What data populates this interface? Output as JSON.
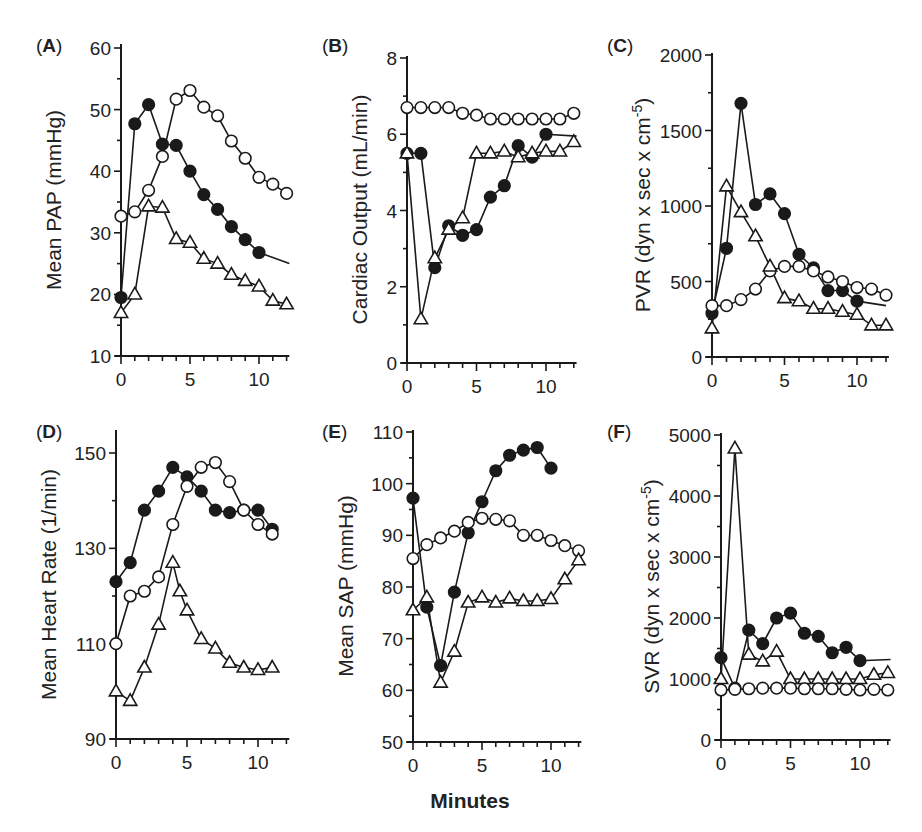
{
  "figure": {
    "xlabel": "Minutes"
  },
  "series_styles": {
    "filled_circle": {
      "marker": "circle",
      "fill": "#1a1a1a",
      "stroke": "#1a1a1a"
    },
    "open_circle": {
      "marker": "circle",
      "fill": "#ffffff",
      "stroke": "#1a1a1a"
    },
    "open_triangle": {
      "marker": "triangle",
      "fill": "#ffffff",
      "stroke": "#1a1a1a"
    }
  },
  "chart_data": [
    {
      "panel": "A",
      "type": "line",
      "ylabel": "Mean PAP (mmHg)",
      "xlabel": "",
      "xlim": [
        0,
        12.2
      ],
      "ylim": [
        10,
        60
      ],
      "xticks": [
        0,
        5,
        10
      ],
      "yticks": [
        10,
        20,
        30,
        40,
        50,
        60
      ],
      "px": {
        "x0": 121,
        "x10": 259,
        "y_axis_bottom": 356,
        "y_min_px": 356,
        "y_max_px": 48,
        "top": 44
      },
      "series": [
        {
          "style": "filled_circle",
          "x": [
            0,
            1,
            2,
            3,
            4,
            5,
            6,
            7,
            8,
            9,
            10
          ],
          "y": [
            19.5,
            47.7,
            50.8,
            44.4,
            44.2,
            40.0,
            36.2,
            33.8,
            31.0,
            28.9,
            26.8
          ],
          "tail": [
            12.2,
            25.0
          ]
        },
        {
          "style": "open_circle",
          "x": [
            0,
            1,
            2,
            3,
            4,
            5,
            6,
            7,
            8,
            9,
            10,
            11,
            12
          ],
          "y": [
            32.7,
            33.4,
            36.9,
            42.4,
            51.7,
            53.1,
            50.4,
            49.0,
            44.9,
            42.1,
            39.0,
            37.9,
            36.4
          ]
        },
        {
          "style": "open_triangle",
          "x": [
            0,
            1,
            2,
            3,
            4,
            5,
            6,
            7,
            8,
            9,
            10,
            11,
            12
          ],
          "y": [
            17.0,
            20.0,
            34.3,
            34.1,
            29.0,
            28.4,
            25.8,
            25.0,
            23.2,
            22.2,
            21.3,
            19.0,
            18.4
          ]
        }
      ]
    },
    {
      "panel": "B",
      "type": "line",
      "ylabel": "Cardiac Output (mL/min)",
      "xlabel": "",
      "xlim": [
        0,
        12.2
      ],
      "ylim": [
        0,
        8
      ],
      "xticks": [
        0,
        5,
        10
      ],
      "yticks": [
        0,
        2,
        4,
        6,
        8
      ],
      "px": {
        "x0": 407,
        "x10": 546,
        "y_axis_bottom": 363,
        "y_min_px": 363,
        "y_max_px": 58,
        "top": 56
      },
      "series": [
        {
          "style": "open_circle",
          "x": [
            0,
            1,
            2,
            3,
            4,
            5,
            6,
            7,
            8,
            9,
            10,
            11,
            12
          ],
          "y": [
            6.7,
            6.7,
            6.7,
            6.7,
            6.55,
            6.5,
            6.4,
            6.4,
            6.4,
            6.4,
            6.4,
            6.4,
            6.55
          ]
        },
        {
          "style": "filled_circle",
          "x": [
            0,
            1,
            2,
            3,
            4,
            5,
            6,
            7,
            8,
            9,
            10
          ],
          "y": [
            5.5,
            5.5,
            2.5,
            3.6,
            3.35,
            3.5,
            4.35,
            4.65,
            5.7,
            5.4,
            6.0
          ],
          "tail": [
            12.2,
            5.95
          ]
        },
        {
          "style": "open_triangle",
          "x": [
            0,
            1,
            2,
            3,
            4,
            5,
            6,
            7,
            8,
            9,
            10,
            11,
            12
          ],
          "y": [
            5.5,
            1.15,
            2.75,
            3.5,
            3.8,
            5.5,
            5.5,
            5.55,
            5.4,
            5.5,
            5.55,
            5.55,
            5.8
          ]
        }
      ]
    },
    {
      "panel": "C",
      "type": "line",
      "ylabel": "PVR (dyn x sec x cm",
      "ylabel_sup": "-5",
      "ylabel_end": ")",
      "xlabel": "",
      "xlim": [
        0,
        12.2
      ],
      "ylim": [
        0,
        2000
      ],
      "xticks": [
        0,
        5,
        10
      ],
      "yticks": [
        0,
        500,
        1000,
        1500,
        2000
      ],
      "px": {
        "x0": 712,
        "x10": 857,
        "y_axis_bottom": 357,
        "y_min_px": 357,
        "y_max_px": 55,
        "top": 53
      },
      "series": [
        {
          "style": "filled_circle",
          "x": [
            0,
            1,
            2,
            3,
            4,
            5,
            6,
            7,
            8,
            9,
            10
          ],
          "y": [
            290,
            720,
            1680,
            1010,
            1080,
            950,
            680,
            590,
            440,
            440,
            370
          ],
          "tail": [
            12,
            340
          ]
        },
        {
          "style": "open_circle",
          "x": [
            0,
            1,
            2,
            3,
            4,
            5,
            6,
            7,
            8,
            9,
            10,
            11,
            12
          ],
          "y": [
            340,
            340,
            380,
            450,
            570,
            600,
            600,
            570,
            530,
            500,
            460,
            450,
            410
          ]
        },
        {
          "style": "open_triangle",
          "x": [
            0,
            1,
            2,
            3,
            4,
            5,
            6,
            7,
            8,
            9,
            10,
            11,
            12
          ],
          "y": [
            190,
            1130,
            960,
            800,
            600,
            390,
            370,
            320,
            320,
            300,
            280,
            210,
            210
          ]
        }
      ]
    },
    {
      "panel": "D",
      "type": "line",
      "ylabel": "Mean Heart Rate (1/min)",
      "xlabel": "",
      "xlim": [
        0,
        12.2
      ],
      "ylim": [
        90,
        155
      ],
      "xticks": [
        0,
        5,
        10
      ],
      "yticks": [
        90,
        110,
        130,
        150
      ],
      "px": {
        "x0": 116,
        "x10": 258,
        "y_axis_bottom": 739,
        "y_min_px": 739,
        "y_max_px": 453,
        "top": 430
      },
      "series": [
        {
          "style": "filled_circle",
          "x": [
            0,
            1,
            2,
            3,
            4,
            5,
            6,
            7,
            8,
            9,
            10,
            11
          ],
          "y": [
            123,
            127,
            138,
            142,
            147,
            145,
            142,
            138,
            137.5,
            138,
            138,
            134
          ]
        },
        {
          "style": "open_circle",
          "x": [
            0,
            1,
            2,
            3,
            4,
            5,
            6,
            7,
            8,
            9,
            10,
            11
          ],
          "y": [
            110,
            120,
            121,
            124,
            135,
            143,
            147,
            148,
            144,
            138,
            135,
            133
          ]
        },
        {
          "style": "open_triangle",
          "x": [
            0,
            1,
            2,
            3,
            4,
            4.5,
            5,
            6,
            7,
            8,
            9,
            10,
            11
          ],
          "y": [
            100,
            98,
            105,
            114,
            127,
            121,
            117,
            111,
            109,
            106,
            105,
            104.5,
            105
          ]
        }
      ]
    },
    {
      "panel": "E",
      "type": "line",
      "ylabel": "Mean SAP (mmHg)",
      "xlabel": "Minutes",
      "xlim": [
        0,
        12.2
      ],
      "ylim": [
        50,
        110
      ],
      "xticks": [
        0,
        5,
        10
      ],
      "yticks": [
        50,
        60,
        70,
        80,
        90,
        100,
        110
      ],
      "px": {
        "x0": 413,
        "x10": 551,
        "y_axis_bottom": 742,
        "y_min_px": 742,
        "y_max_px": 432,
        "top": 430
      },
      "series": [
        {
          "style": "filled_circle",
          "x": [
            0,
            1,
            2,
            3,
            4,
            5,
            6,
            7,
            8,
            9,
            10
          ],
          "y": [
            97.2,
            76.1,
            64.8,
            79.0,
            90.5,
            96.5,
            102.5,
            105.5,
            106.5,
            107.0,
            103.0
          ]
        },
        {
          "style": "open_circle",
          "x": [
            0,
            1,
            2,
            3,
            4,
            5,
            6,
            7,
            8,
            9,
            10,
            11,
            12
          ],
          "y": [
            85.5,
            88.2,
            89.5,
            90.8,
            92.5,
            93.3,
            93.1,
            92.8,
            90.0,
            90.0,
            89.0,
            88.0,
            87.0
          ]
        },
        {
          "style": "open_triangle",
          "x": [
            0,
            1,
            2,
            3,
            4,
            5,
            6,
            7,
            8,
            9,
            10,
            11,
            12
          ],
          "y": [
            75.5,
            78.0,
            61.5,
            67.5,
            77.0,
            78.0,
            77.0,
            77.8,
            77.3,
            77.3,
            77.7,
            81.5,
            85.2
          ]
        }
      ]
    },
    {
      "panel": "F",
      "type": "line",
      "ylabel": "SVR (dyn x sec x cm",
      "ylabel_sup": "-5",
      "ylabel_end": ")",
      "xlabel": "",
      "xlim": [
        0,
        12.2
      ],
      "ylim": [
        0,
        5000
      ],
      "xticks": [
        0,
        5,
        10
      ],
      "yticks": [
        0,
        1000,
        2000,
        3000,
        4000,
        5000
      ],
      "px": {
        "x0": 721,
        "x10": 860,
        "y_axis_bottom": 740,
        "y_min_px": 740,
        "y_max_px": 435,
        "top": 433
      },
      "series": [
        {
          "style": "filled_circle",
          "x": [
            0,
            1,
            2,
            3,
            4,
            5,
            6,
            7,
            8,
            9,
            10
          ],
          "y": [
            1350,
            850,
            1800,
            1580,
            2000,
            2080,
            1750,
            1700,
            1430,
            1520,
            1300
          ],
          "tail": [
            12.2,
            1320
          ]
        },
        {
          "style": "open_triangle",
          "x": [
            0,
            1,
            2,
            3,
            4,
            5,
            6,
            7,
            8,
            9,
            10,
            11,
            12
          ],
          "y": [
            1000,
            4780,
            1400,
            1290,
            1450,
            1000,
            1000,
            1000,
            1000,
            1000,
            1000,
            1070,
            1100
          ]
        },
        {
          "style": "open_circle",
          "x": [
            0,
            1,
            2,
            3,
            4,
            5,
            6,
            7,
            8,
            9,
            10,
            11,
            12
          ],
          "y": [
            820,
            830,
            840,
            850,
            850,
            850,
            840,
            840,
            840,
            830,
            820,
            830,
            820
          ]
        }
      ]
    }
  ]
}
